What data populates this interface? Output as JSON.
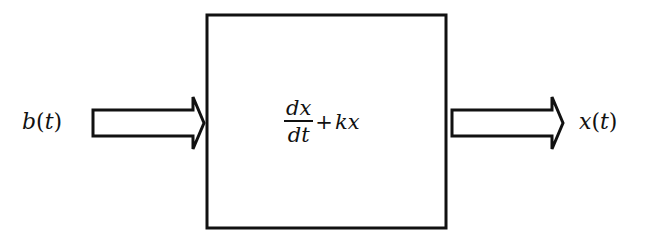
{
  "diagram": {
    "type": "block-diagram",
    "input": {
      "label_var": "b",
      "label_paren_open": "(",
      "label_arg": "t",
      "label_paren_close": ")"
    },
    "block": {
      "fraction_numerator": "dx",
      "fraction_denominator": "dt",
      "plus": "+",
      "term": "kx"
    },
    "output": {
      "label_var": "x",
      "label_paren_open": "(",
      "label_arg": "t",
      "label_paren_close": ")"
    },
    "colors": {
      "stroke": "#111111",
      "background": "#ffffff"
    }
  }
}
